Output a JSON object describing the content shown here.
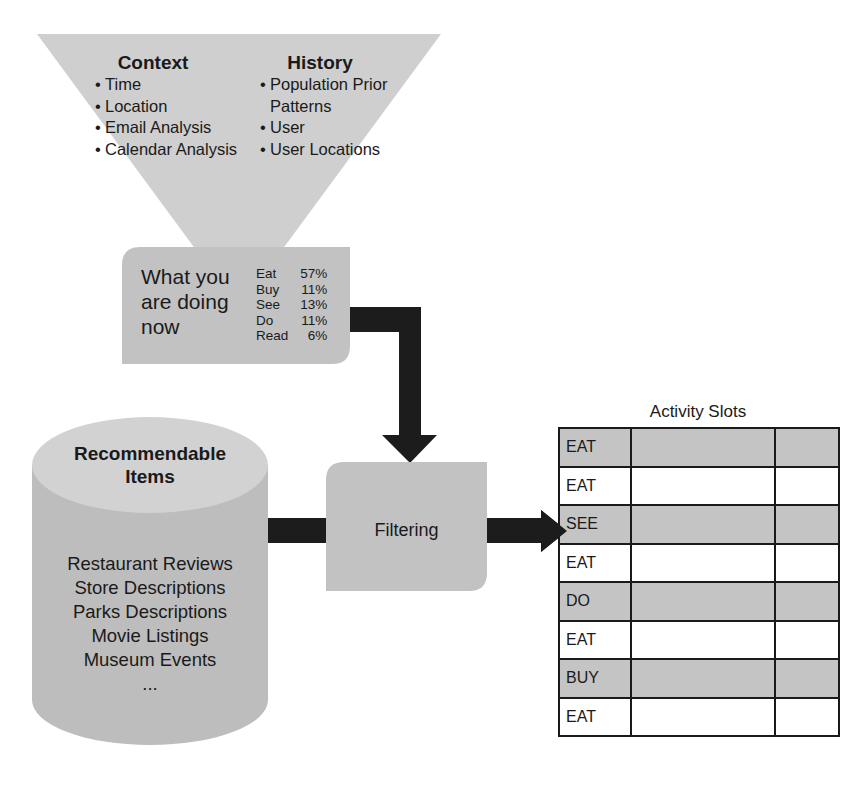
{
  "funnel": {
    "context": {
      "title": "Context",
      "items": [
        "Time",
        "Location",
        "Email Analysis",
        "Calendar Analysis"
      ]
    },
    "history": {
      "title": "History",
      "items": [
        {
          "text": "Population Prior",
          "bullet": true
        },
        {
          "text": "Patterns",
          "bullet": false
        },
        {
          "text": "User",
          "bullet": true
        },
        {
          "text": "User Locations",
          "bullet": true
        }
      ]
    }
  },
  "now_box": {
    "title_lines": [
      "What you",
      "are doing",
      "now"
    ],
    "activities": [
      {
        "label": "Eat",
        "pct": "57%"
      },
      {
        "label": "Buy",
        "pct": "11%"
      },
      {
        "label": "See",
        "pct": "13%"
      },
      {
        "label": "Do",
        "pct": "11%"
      },
      {
        "label": "Read",
        "pct": "6%"
      }
    ]
  },
  "cylinder": {
    "title_lines": [
      "Recommendable",
      "Items"
    ],
    "items": [
      "Restaurant Reviews",
      "Store Descriptions",
      "Parks Descriptions",
      "Movie Listings",
      "Museum Events",
      "..."
    ]
  },
  "filter": {
    "label": "Filtering"
  },
  "slots": {
    "title": "Activity Slots",
    "rows": [
      {
        "label": "EAT",
        "shaded": true
      },
      {
        "label": "EAT",
        "shaded": false
      },
      {
        "label": "SEE",
        "shaded": true
      },
      {
        "label": "EAT",
        "shaded": false
      },
      {
        "label": "DO",
        "shaded": true
      },
      {
        "label": "EAT",
        "shaded": false
      },
      {
        "label": "BUY",
        "shaded": true
      },
      {
        "label": "EAT",
        "shaded": false
      }
    ]
  },
  "colors": {
    "funnel": "#cfcfcf",
    "box": "#c2c2c2",
    "cylinder_body": "#bdbdbd",
    "cylinder_cap": "#d2d2d2",
    "arrow": "#1c1c1c",
    "slot_shaded": "#c4c4c4",
    "border": "#1a1a1a"
  }
}
